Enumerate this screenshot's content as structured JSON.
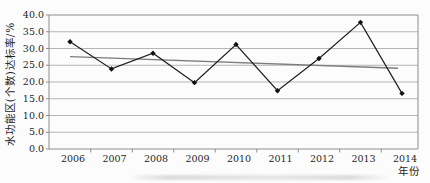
{
  "chart_data": {
    "type": "line",
    "title": "",
    "xlabel": "年份",
    "ylabel": "水功能区(个数)达标率/%",
    "categories": [
      "2006",
      "2007",
      "2008",
      "2009",
      "2010",
      "2011",
      "2012",
      "2013",
      "2014"
    ],
    "values": [
      32.0,
      23.9,
      28.6,
      19.8,
      31.2,
      17.4,
      27.0,
      37.8,
      16.6
    ],
    "trendline": {
      "description": "linear-trend",
      "start_value": 27.6,
      "end_value": 24.1,
      "color": "#7d7d7d"
    },
    "ylim": [
      0,
      40
    ],
    "ytick_step": 5,
    "ytick_labels": [
      "0.0",
      "5.0",
      "10.0",
      "15.0",
      "20.0",
      "25.0",
      "30.0",
      "35.0",
      "40.0"
    ],
    "grid": "horizontal",
    "legend": "none",
    "line_color": "#1c1c1c",
    "marker": "diamond",
    "marker_color": "#111111"
  },
  "colors": {
    "grid": "#b5b5b5",
    "frame": "#8e8e8e",
    "background": "#fcfcfc",
    "text": "#1f1f1f"
  }
}
